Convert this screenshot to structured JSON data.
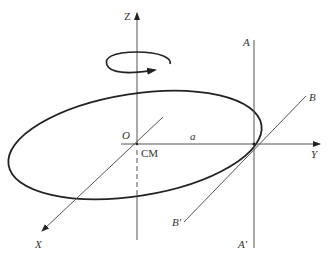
{
  "diagram": {
    "type": "rotating-disk-axes",
    "colors": {
      "background": "#ffffff",
      "stroke": "#222222",
      "thin_line": "#555555",
      "text": "#333333"
    },
    "labels": {
      "z_axis": "Z",
      "y_axis": "Y",
      "x_axis": "X",
      "origin": "O",
      "center_of_mass": "CM",
      "radius": "a",
      "line_a_top": "A",
      "line_a_bottom": "A′",
      "line_b_top": "B",
      "line_b_bottom": "B′"
    },
    "elements": [
      {
        "name": "Z axis",
        "kind": "vertical line with arrow",
        "dashed_segment": "inside disk below O"
      },
      {
        "name": "rotation arrow",
        "kind": "circular arrow around Z axis"
      },
      {
        "name": "disk",
        "kind": "tilted ellipse"
      },
      {
        "name": "Y axis",
        "kind": "horizontal line with arrow"
      },
      {
        "name": "X axis",
        "kind": "diagonal line with arrow"
      },
      {
        "name": "AA′",
        "kind": "vertical line through contact point"
      },
      {
        "name": "BB′",
        "kind": "diagonal line tangent to disk at contact point"
      }
    ]
  }
}
